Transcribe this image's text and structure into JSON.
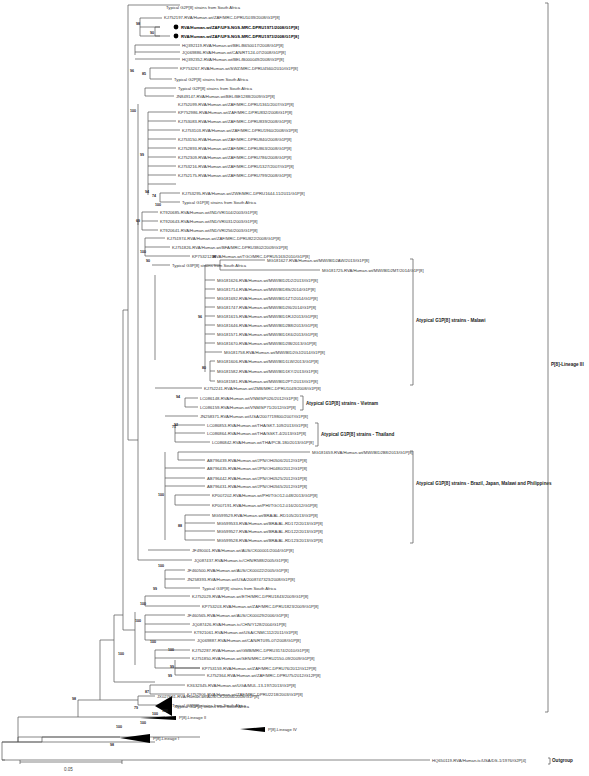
{
  "figure": {
    "type": "phylogenetic-tree",
    "scale_bar": {
      "label": "0.05"
    },
    "leaves": [
      {
        "label": "Typical G2P[8] strains from South Africa"
      },
      {
        "label": "KJ752197-RVA/Human-wt/ZAF/MRC-DPRU1039/2008/G1P[8]"
      },
      {
        "label": "RVA/Human-wt/ZAF/UFS-NGS-MRC-DPRU1971/2008/G1P[8]",
        "highlight": true
      },
      {
        "label": "RVA/Human-wt/ZAF/UFS-NGS-MRC-DPRU1973/2008/G1P[8]",
        "highlight": true
      },
      {
        "label": "HQ392119-RVA/Human-wt/BEL/B650017/2008/G1P[8]"
      },
      {
        "label": "JQ069886-RVA/Human-wt/CAN/RT124-07/2008/G1P[8]"
      },
      {
        "label": "HQ392352-RVA/Human-wt/BEL/B000049/2008/G1P[8]"
      },
      {
        "label": "KP753267-RVA/Human-wt/SWZ/MRC-DPRU4560/2010/G1P[8]"
      },
      {
        "label": "Typical G2P[8] strains from South Africa"
      },
      {
        "label": "Typical G2P[8] strains from South Africa"
      },
      {
        "label": "JN849147-RVA/Human-wt/BEL/BE1288/2009/G1P[8]"
      },
      {
        "label": "KJ752099-RVA/Human-wt/ZAF/MRC-DPRU1361/2007/G1P[8]"
      },
      {
        "label": "KP752986-RVA/Human-wt/ZAF/MRC-DPRU832/2008/G1P[8]"
      },
      {
        "label": "KJ753083-RVA/Human-wt/ZAF/MRC-DPRU839/2008/G1P[8]"
      },
      {
        "label": "KJ753103-RVA/Human-wt/ZAF/MRC-DPRU1960/2008/G1P[8]"
      },
      {
        "label": "KJ753150-RVA/Human-wt/ZAF/MRC-DPRU840/2008/G1P[8]"
      },
      {
        "label": "KJ752893-RVA/Human-wt/ZAF/MRC-DPRU863/2008/G1P[8]"
      },
      {
        "label": "KJ752309-RVA/Human-wt/ZAF/MRC-DPRU786/2008/G1P[8]"
      },
      {
        "label": "KJ753216-RVA/Human-wt/ZAF/MRC-DPRU1327/2007/G1P[8]"
      },
      {
        "label": "KJ752175-RVA/Human-wt/ZAF/MRC-DPRU799/2008/G1P[8]"
      },
      {
        "label": "KJ753295-RVA/Human-wt/ZWE/MRC-DPRU1644-11/2011/G1P[8]"
      },
      {
        "label": "Typical G1P[8] strains from South Africa"
      },
      {
        "label": "KT920685-RVA/Human-wt/IND/VRI104/2003/G1P[8]"
      },
      {
        "label": "KT920643-RVA/Human-wt/IND/VRI031/2003/G1P[8]"
      },
      {
        "label": "KT920641-RVA/Human-wt/IND/VRI256/2003/G1P[8]"
      },
      {
        "label": "KJ751974-RVA/Human-wt/ZAF/MRC-DPRU822/2008/G1P[8]"
      },
      {
        "label": "KJ751826-RVA/Human-wt/BFA/MRC-DPRU3802/2009/G1P[8]"
      },
      {
        "label": "KP753212-RVA/Human-wt/TGO/MRC-DPRU5163/2010/G1P[8]"
      },
      {
        "label": "Typical G3P[8] strains from South Africa"
      },
      {
        "label": "MG181627-RVA/Human-wt/MWI/BID2AW/2013/G1P[8]"
      },
      {
        "label": "MG181725-RVA/Human-wt/MWI/BID2MT/2014/G1P[8]"
      },
      {
        "label": "MG181626-RVA/Human-wt/MWI/BID2D2/2013/G1P[8]"
      },
      {
        "label": "MG181714-RVA/Human-wt/MWI/BID8S/2014/G1P[8]"
      },
      {
        "label": "MG181692-RVA/Human-wt/MWI/BID1ZT/2014/G1P[8]"
      },
      {
        "label": "MG181747-RVA/Human-wt/MWI/BID2I6/2014/G1P[8]"
      },
      {
        "label": "MG181615-RVA/Human-wt/MWI/BID1RJ/2013/G1P[8]"
      },
      {
        "label": "MG181646-RVA/Human-wt/MWI/BID2B8/2013/G1P[8]"
      },
      {
        "label": "MG181571-RVA/Human-wt/MWI/BID1K6/2013/G1P[8]"
      },
      {
        "label": "MG181670-RVA/Human-wt/MWI/BID2IB/2013/G1P[8]"
      },
      {
        "label": "MG181758-RVA/Human-wt/MWI/BID2GJ/2014/G1P[8]"
      },
      {
        "label": "MG181606-RVA/Human-wt/MWI/BID1LW/2013/G1P[8]"
      },
      {
        "label": "MG181582-RVA/Human-wt/MWI/BID1KY/2013/G1P[8]"
      },
      {
        "label": "MG181581-RVA/Human-wt/MWI/BID2PT/2013/G1P[8]"
      },
      {
        "label": "KJ752241-RVA/Human-wt/ZMB/MRC-DPRU1049/2008/G1P[8]"
      },
      {
        "label": "LC086148-RVA/Human-wt/VNM/SP026/2012/G1P[8]"
      },
      {
        "label": "LC086159-RVA/Human-wt/VNM/SP71/2012/G1P[8]"
      },
      {
        "label": "JN258371-RVA/Human-wt/USA/2007719800/2007/G1P[8]"
      },
      {
        "label": "LC086853-RVA/Human-wt/THA/SKT-109/2013/G1P[8]"
      },
      {
        "label": "LC086864-RVA/Human-wt/THA/SSKT-4/2013/G1P[8]"
      },
      {
        "label": "LC086842-RVA/Human-wt/THA/PCB-180/2013/G1P[8]"
      },
      {
        "label": "MG181659-RVA/Human-wt/MWI/BID2B8/2013/G1P[8]"
      },
      {
        "label": "AB796439-RVA/Human-wt/JPN/OH0506/2012/G1P[8]"
      },
      {
        "label": "AB796435-RVA/Human-wt/JPN/OH0480/2012/G1P[8]"
      },
      {
        "label": "AB796442-RVA/Human-wt/JPN/OH0525/2012/G1P[8]"
      },
      {
        "label": "AB796431-RVA/Human-wt/JPN/OH0565/2012/G1P[8]"
      },
      {
        "label": "KP007202-RVA/Human-wt/PHI/TGO12-048/2013/G1P[8]"
      },
      {
        "label": "KP007191-RVA/Human-wt/PHI/TGO12-016/2012/G1P[8]"
      },
      {
        "label": "MG599529-RVA/Human-wt/BRA/AL-RD105/2013/G1P[8]"
      },
      {
        "label": "MG599533-RVA/Human-wt/BRA/AL-RD172/2013/G1P[8]"
      },
      {
        "label": "MG599527-RVA/Human-wt/BRA/AL-RD122/2013/G1P[8]"
      },
      {
        "label": "MG599528-RVA/Human-wt/BRA/AL-RD123/2013/G1P[8]"
      },
      {
        "label": "JF490001-RVA/Human-wt/AUS/CK00001/2004/G1P[8]"
      },
      {
        "label": "JQ087437-RVA/Human-tc/CHN/R588/2005/G1P[8]"
      },
      {
        "label": "JF460500-RVA/Human-wt/AUS/CK00022/2005/G1P[8]"
      },
      {
        "label": "JN258393-RVA/Human-wt/USA/2008747323/2008/G1P[8]"
      },
      {
        "label": "Typical G3P[8] strains from South Africa"
      },
      {
        "label": "KJ752029-RVA/Human-wt/ETH/MRC-DPRU1843/2009/G1P[8]"
      },
      {
        "label": "KP753203-RVA/Human-wt/ZAF/MRC-DPRU1823/2009/G1P[8]"
      },
      {
        "label": "JF460565-RVA/Human-wt/AUS/CK00029/2006/G1P[8]"
      },
      {
        "label": "JQ087426-RVA/Human-tc/CHN/Y128/2004/G1P[8]"
      },
      {
        "label": "KT921061-RVA/Human-wt/USA/CNMC112/2011/G1P[8]"
      },
      {
        "label": "JQ069887-RVA/Human-wt/CAN/RT095-07/2008/G1P[8]"
      },
      {
        "label": "KJ752287-RVA/Human-wt/GMB/MRC-DPRU3174/2010/G1P[8]"
      },
      {
        "label": "KJ751850-RVA/Human-wt/SEN/MRC-DPRU2150-09/2009/G1P[8]"
      },
      {
        "label": "KP753159-RVA/Human-wt/ZAF/MRC-DPRU76/2012/G12P[8]"
      },
      {
        "label": "KJ752364-RVA/Human-wt/ZAF/MRC-DPRU75/2012/G12P[8]"
      },
      {
        "label": "KX632345-RVA/Human-wt/UGA/MUL-13-197/2013/G1P[8]"
      },
      {
        "label": "KJ752906-RVA/Human-wt/ZAF/MRC-DPRU2218/2003/G1P[8]"
      },
      {
        "label": "Typical G4P[8] strains from South Africa"
      },
      {
        "label": "JX027631-RVA/Human-wt/AUS/CK20056/2008/G1P[8]"
      },
      {
        "label": "Typical G9P[8] strains from South Africa"
      },
      {
        "label": "P[8]-Lineage II"
      },
      {
        "label": "P[8]-Lineage IV"
      },
      {
        "label": "P[8]-Lineage I"
      },
      {
        "label": "HQ650119-RVA/Human-tc/USA/DS-1/1976/G2P[4]"
      }
    ],
    "groups": [
      {
        "label": "Atypical G1P[8] strains - Malawi"
      },
      {
        "label": "Atypical G1P[8] strains - Vietnam"
      },
      {
        "label": "Atypical G1P[8] strains - Thailand"
      },
      {
        "label": "Atypical G1P[8] strains - Brazil, Japan, Malawi and Philippines"
      },
      {
        "label": "P[8]-Lineage III"
      },
      {
        "label": "Outgroup"
      }
    ],
    "bootstrap": [
      "98",
      "90",
      "85",
      "96",
      "100",
      "99",
      "94",
      "74",
      "100",
      "69",
      "100",
      "90",
      "98",
      "96",
      "80",
      "94",
      "71",
      "92",
      "100",
      "88",
      "100",
      "99",
      "100",
      "100",
      "100",
      "100",
      "99",
      "99",
      "87",
      "100",
      "100",
      "98",
      "79",
      "100",
      "100",
      "100",
      "98"
    ]
  }
}
